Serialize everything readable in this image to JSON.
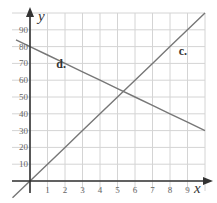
{
  "chart_data": {
    "type": "line",
    "title": "",
    "xlabel": "x",
    "ylabel": "y",
    "xlim": [
      0,
      10
    ],
    "ylim": [
      0,
      100
    ],
    "grid": true,
    "x_ticks": [
      "1",
      "2",
      "3",
      "4",
      "5",
      "6",
      "7",
      "8",
      "9"
    ],
    "y_ticks": [
      "10",
      "20",
      "30",
      "40",
      "50",
      "60",
      "70",
      "80",
      "90"
    ],
    "series": [
      {
        "name": "c.",
        "equation": "y = 10x",
        "x": [
          -1,
          0,
          1,
          2,
          3,
          4,
          5,
          6,
          7,
          8,
          9,
          10
        ],
        "values": [
          -10,
          0,
          10,
          20,
          30,
          40,
          50,
          60,
          70,
          80,
          90,
          100
        ]
      },
      {
        "name": "d.",
        "equation": "y = 80 - 5x",
        "x": [
          -0.8,
          0,
          1,
          2,
          3,
          4,
          5,
          6,
          7,
          8,
          9,
          10
        ],
        "values": [
          84,
          80,
          75,
          70,
          65,
          60,
          55,
          50,
          45,
          40,
          35,
          30
        ]
      }
    ],
    "annotations": [
      {
        "text": "c.",
        "x": 8.5,
        "y": 75
      },
      {
        "text": "d.",
        "x": 1.5,
        "y": 67
      }
    ],
    "intersection": {
      "x": 5.3,
      "y": 53
    }
  },
  "colors": {
    "line": "#777777",
    "axis": "#333333",
    "grid": "#d4d4d4",
    "text": "#555555"
  }
}
